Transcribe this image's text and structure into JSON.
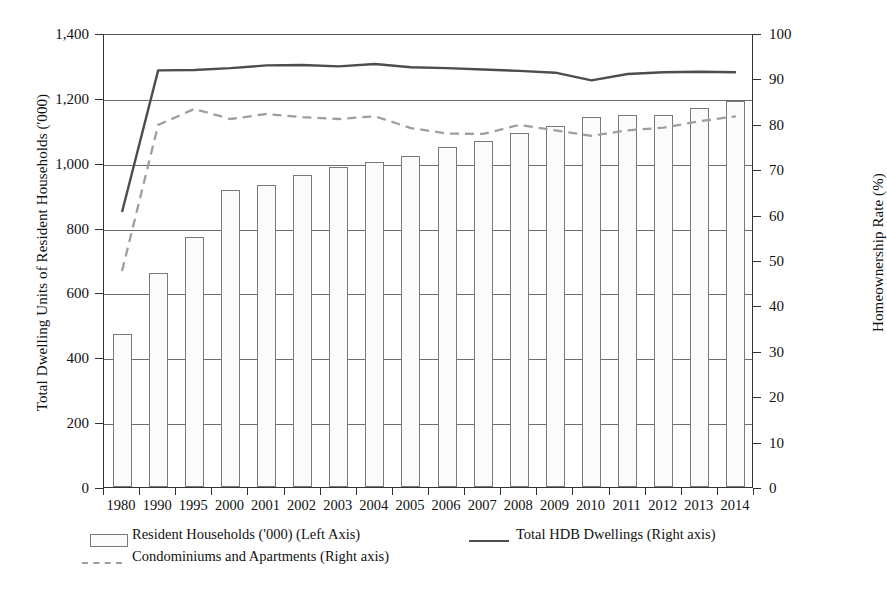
{
  "chart_data": {
    "type": "bar",
    "title": "",
    "xlabel": "",
    "ylabel": "Total Dwelling Units of Resident Households ('000)",
    "y2label": "Homeownership Rate (%)",
    "grid": true,
    "legend_position": "bottom-left",
    "ylim": [
      0,
      1400
    ],
    "y2lim": [
      0,
      100
    ],
    "ytick_labels": [
      "1,400",
      "1,200",
      "1,000",
      "800",
      "600",
      "400",
      "200",
      "0"
    ],
    "ytick_values": [
      1400,
      1200,
      1000,
      800,
      600,
      400,
      200,
      0
    ],
    "y2tick_labels": [
      "100",
      "90",
      "80",
      "70",
      "60",
      "50",
      "40",
      "30",
      "20",
      "10",
      "0"
    ],
    "y2tick_values": [
      100,
      90,
      80,
      70,
      60,
      50,
      40,
      30,
      20,
      10,
      0
    ],
    "categories": [
      "1980",
      "1990",
      "1995",
      "2000",
      "2001",
      "2002",
      "2003",
      "2004",
      "2005",
      "2006",
      "2007",
      "2008",
      "2009",
      "2010",
      "2011",
      "2012",
      "2013",
      "2014"
    ],
    "series": [
      {
        "name": "Resident Households ('000) (Left Axis)",
        "type": "bar",
        "axis": "left",
        "values": [
          473,
          660,
          772,
          915,
          932,
          961,
          986,
          1001,
          1022,
          1050,
          1068,
          1091,
          1112,
          1141,
          1146,
          1146,
          1169,
          1191
        ]
      },
      {
        "name": "Total HDB Dwellings (Right axis)",
        "type": "line",
        "style": "solid",
        "axis": "right",
        "values": [
          61.0,
          92.2,
          92.3,
          92.7,
          93.3,
          93.4,
          93.1,
          93.6,
          92.9,
          92.7,
          92.4,
          92.1,
          91.7,
          90.0,
          91.4,
          91.8,
          91.9,
          91.8
        ]
      },
      {
        "name": "Condominiums and Apartments (Right axis)",
        "type": "line",
        "style": "dashed",
        "axis": "right",
        "values": [
          48.0,
          80.2,
          83.7,
          81.5,
          82.6,
          81.9,
          81.5,
          82.1,
          79.5,
          78.3,
          78.2,
          80.2,
          79.0,
          77.8,
          79.0,
          79.6,
          81.0,
          82.1
        ]
      }
    ]
  },
  "legend": {
    "items": [
      {
        "label": "Resident Households ('000) (Left Axis)",
        "marker": "bar-swatch"
      },
      {
        "label": "Total HDB Dwellings (Right axis)",
        "marker": "solid-line"
      },
      {
        "label": "Condominiums and Apartments (Right axis)",
        "marker": "dashed-line"
      }
    ]
  },
  "colors": {
    "bar_fill": "#fbfbfb",
    "bar_border": "#7a7a7a",
    "solid_line": "#4d4d4d",
    "dashed_line": "#9e9e9e",
    "grid": "#6e6e6e",
    "axis": "#333333"
  }
}
